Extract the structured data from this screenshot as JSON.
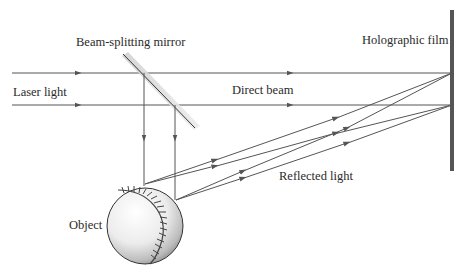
{
  "labels": {
    "mirror": "Beam-splitting mirror",
    "laser": "Laser light",
    "direct": "Direct beam",
    "film": "Holographic film",
    "reflected": "Reflected light",
    "object": "Object"
  },
  "colors": {
    "ray": "#555555",
    "film": "#555555",
    "mirror_shadow": "#cfcfcf",
    "text": "#2a2a2a"
  },
  "geometry": {
    "beam_top_y": 73,
    "beam_bottom_y": 105,
    "film_x": 452,
    "film_y_range": [
      10,
      170
    ],
    "mirror_line": [
      [
        124,
        54
      ],
      [
        196,
        128
      ]
    ],
    "object_center": [
      145,
      226
    ],
    "object_radius": 38
  }
}
